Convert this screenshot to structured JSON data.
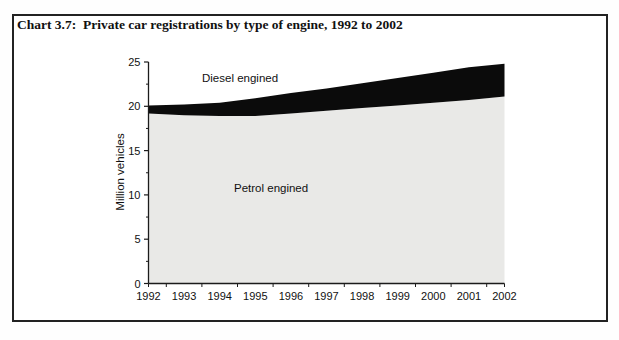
{
  "title": "Chart 3.7:  Private car registrations by type of engine, 1992 to 2002",
  "chart": {
    "ylabel": "Million vehicles",
    "diesel_area_label": "Diesel engined",
    "petrol_area_label": "Petrol engined"
  },
  "colors": {
    "diesel_fill": "#0b0b0b",
    "petrol_fill": "#e9e9e7",
    "axis": "#1b1b1b",
    "frame_border": "#222222",
    "text": "#111111"
  },
  "chart_data": {
    "type": "area",
    "stacked": true,
    "title": "Private car registrations by type of engine, 1992 to 2002",
    "xlabel": "",
    "ylabel": "Million vehicles",
    "categories": [
      "1992",
      "1993",
      "1994",
      "1995",
      "1996",
      "1997",
      "1998",
      "1999",
      "2000",
      "2001",
      "2002"
    ],
    "series": [
      {
        "name": "Petrol engined",
        "color": "#e9e9e7",
        "values": [
          19.2,
          19.0,
          18.9,
          18.9,
          19.2,
          19.5,
          19.8,
          20.1,
          20.4,
          20.7,
          21.1
        ]
      },
      {
        "name": "Diesel engined",
        "color": "#0b0b0b",
        "values": [
          0.9,
          1.2,
          1.5,
          2.0,
          2.3,
          2.5,
          2.8,
          3.1,
          3.4,
          3.7,
          3.7
        ]
      }
    ],
    "totals": [
      20.1,
      20.2,
      20.4,
      20.9,
      21.5,
      22.0,
      22.6,
      23.2,
      23.8,
      24.4,
      24.8
    ],
    "ylim": [
      0,
      25
    ],
    "y_ticks": [
      0,
      5,
      10,
      15,
      20,
      25
    ],
    "y_minor_tick_step": 2.5,
    "grid": false,
    "legend_position": "none (series labelled inside plot area)"
  }
}
